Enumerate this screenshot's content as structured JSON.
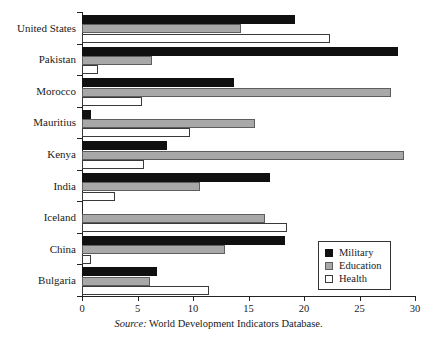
{
  "caption": {
    "source_word": "Source:",
    "source_text": " World Development Indicators Database."
  },
  "legend": {
    "position": "bottom-right",
    "items": [
      {
        "label": "Military",
        "color": "#101010"
      },
      {
        "label": "Education",
        "color": "#a8a8a8"
      },
      {
        "label": "Health",
        "color": "#ffffff"
      }
    ]
  },
  "axis": {
    "xticklabels": [
      "0",
      "5",
      "10",
      "15",
      "20",
      "25",
      "30"
    ]
  },
  "chart_data": {
    "type": "bar",
    "orientation": "horizontal",
    "title": "",
    "xlabel": "",
    "ylabel": "",
    "xlim": [
      0,
      30
    ],
    "xticks": [
      0,
      5,
      10,
      15,
      20,
      25,
      30
    ],
    "grid": false,
    "legend_position": "bottom-right",
    "categories": [
      "United States",
      "Pakistan",
      "Morocco",
      "Mauritius",
      "Kenya",
      "India",
      "Iceland",
      "China",
      "Bulgaria"
    ],
    "series": [
      {
        "name": "Military",
        "color": "#101010",
        "values": [
          19.2,
          28.5,
          13.7,
          0.8,
          7.7,
          16.9,
          0.0,
          18.3,
          6.8
        ]
      },
      {
        "name": "Education",
        "color": "#a8a8a8",
        "values": [
          14.3,
          6.3,
          27.8,
          15.6,
          29.0,
          10.6,
          16.5,
          12.9,
          6.1
        ]
      },
      {
        "name": "Health",
        "color": "#ffffff",
        "values": [
          22.3,
          1.4,
          5.4,
          9.7,
          5.6,
          3.0,
          18.5,
          0.8,
          11.4
        ]
      }
    ]
  }
}
